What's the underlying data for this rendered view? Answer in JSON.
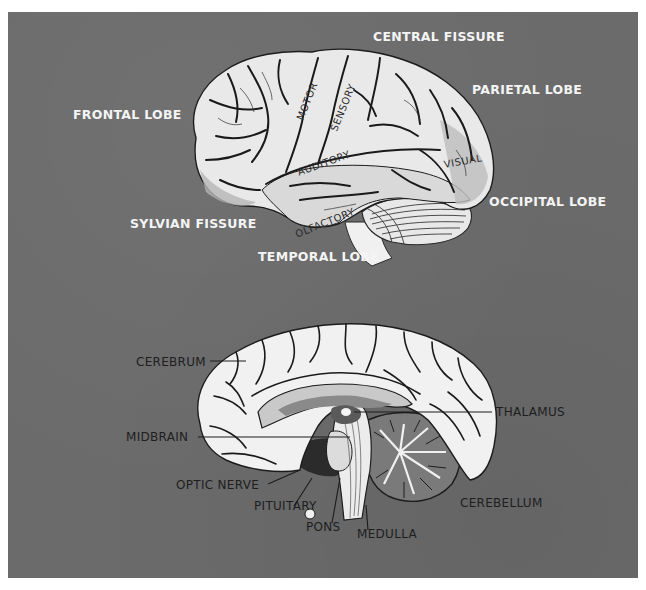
{
  "figure": {
    "background_color": "#6b6b6b",
    "lateral_view": {
      "labels": [
        {
          "id": "central-fissure",
          "text": "CENTRAL FISSURE"
        },
        {
          "id": "parietal-lobe",
          "text": "PARIETAL LOBE"
        },
        {
          "id": "frontal-lobe",
          "text": "FRONTAL LOBE"
        },
        {
          "id": "occipital-lobe",
          "text": "OCCIPITAL LOBE"
        },
        {
          "id": "sylvian-fissure",
          "text": "SYLVIAN FISSURE"
        },
        {
          "id": "temporal-lobe",
          "text": "TEMPORAL LOBE"
        }
      ],
      "area_labels": [
        {
          "id": "motor",
          "text": "MOTOR"
        },
        {
          "id": "sensory",
          "text": "SENSORY"
        },
        {
          "id": "auditory",
          "text": "AUDITORY"
        },
        {
          "id": "visual",
          "text": "VISUAL"
        },
        {
          "id": "olfactory",
          "text": "OLFACTORY"
        }
      ]
    },
    "medial_view": {
      "labels": [
        {
          "id": "cerebrum",
          "text": "CEREBRUM"
        },
        {
          "id": "thalamus",
          "text": "THALAMUS"
        },
        {
          "id": "midbrain",
          "text": "MIDBRAIN"
        },
        {
          "id": "optic-nerve",
          "text": "OPTIC NERVE"
        },
        {
          "id": "pituitary",
          "text": "PITUITARY"
        },
        {
          "id": "cerebellum",
          "text": "CEREBELLUM"
        },
        {
          "id": "pons",
          "text": "PONS"
        },
        {
          "id": "medulla",
          "text": "MEDULLA"
        }
      ]
    }
  }
}
